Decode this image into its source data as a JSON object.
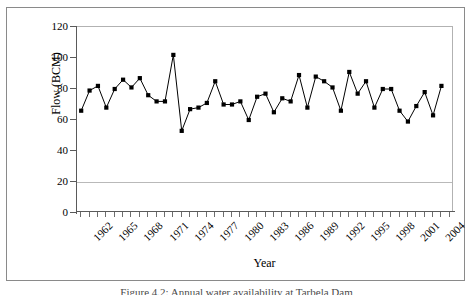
{
  "figure": {
    "caption": "Figure 4.2: Annual water availability at Tarbela Dam"
  },
  "chart_data": {
    "type": "line",
    "title": "",
    "xlabel": "Year",
    "ylabel": "Flow (BCM)",
    "ylim": [
      0,
      120
    ],
    "ytick_step": 20,
    "ytick_labels": [
      "0",
      "20",
      "40",
      "60",
      "80",
      "100",
      "120"
    ],
    "xlim": [
      1962,
      2006
    ],
    "xtick_label_step": 3,
    "xtick_labels": [
      "1962",
      "1965",
      "1968",
      "1971",
      "1974",
      "1977",
      "1980",
      "1983",
      "1986",
      "1989",
      "1992",
      "1995",
      "1998",
      "2001",
      "2004"
    ],
    "grid": "horizontal-gridline-at-20",
    "legend": "none",
    "marker": "filled-square",
    "line_color": "#000000",
    "marker_color": "#000000",
    "x": [
      1962,
      1963,
      1964,
      1965,
      1966,
      1967,
      1968,
      1969,
      1970,
      1971,
      1972,
      1973,
      1974,
      1975,
      1976,
      1977,
      1978,
      1979,
      1980,
      1981,
      1982,
      1983,
      1984,
      1985,
      1986,
      1987,
      1988,
      1989,
      1990,
      1991,
      1992,
      1993,
      1994,
      1995,
      1996,
      1997,
      1998,
      1999,
      2000,
      2001,
      2002,
      2003,
      2004,
      2005
    ],
    "values": [
      66,
      79,
      82,
      68,
      80,
      86,
      81,
      87,
      76,
      72,
      72,
      102,
      53,
      67,
      68,
      71,
      85,
      70,
      70,
      72,
      60,
      75,
      77,
      65,
      74,
      72,
      89,
      68,
      88,
      85,
      81,
      66,
      91,
      77,
      85,
      68,
      80,
      80,
      66,
      59,
      69,
      78,
      63,
      82
    ],
    "series": [
      {
        "name": "Annual flow",
        "values": [
          66,
          79,
          82,
          68,
          80,
          86,
          81,
          87,
          76,
          72,
          72,
          102,
          53,
          67,
          68,
          71,
          85,
          70,
          70,
          72,
          60,
          75,
          77,
          65,
          74,
          72,
          89,
          68,
          88,
          85,
          81,
          66,
          91,
          77,
          85,
          68,
          80,
          80,
          66,
          59,
          69,
          78,
          63,
          82
        ]
      }
    ]
  }
}
